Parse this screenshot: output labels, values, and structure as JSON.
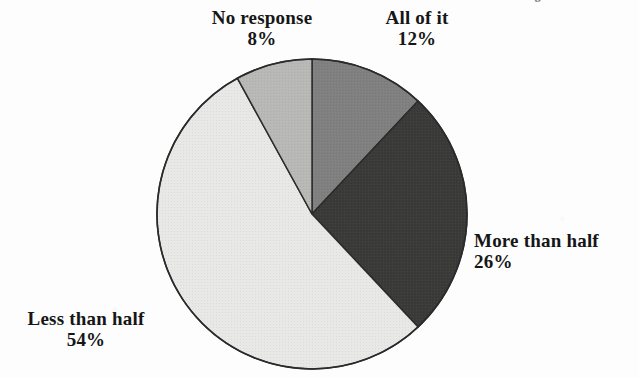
{
  "page": {
    "background_color": "#fdfdfd",
    "width": 639,
    "height": 377,
    "title_remnant": "g"
  },
  "chart_data": {
    "type": "pie",
    "title": "",
    "xlabel": "",
    "ylabel": "",
    "legend_position": "outside-labels",
    "grid": false,
    "start_angle_deg": 0,
    "direction": "clockwise",
    "center": {
      "x": 312,
      "y": 214
    },
    "radius": 155,
    "outline_color": "#2b2b2b",
    "categories": [
      "All of it",
      "More than half",
      "Less than half",
      "No response"
    ],
    "values": [
      12,
      26,
      54,
      8
    ],
    "value_suffix": "%",
    "colors": [
      "#808080",
      "#3a3a38",
      "#e8e8e6",
      "#b8b8b6"
    ],
    "slices": [
      {
        "label": "All of it",
        "percent_text": "12%",
        "value": 12,
        "color": "#808080",
        "start_deg": 0,
        "end_deg": 43.2
      },
      {
        "label": "More than half",
        "percent_text": "26%",
        "value": 26,
        "color": "#3a3a38",
        "start_deg": 43.2,
        "end_deg": 136.8
      },
      {
        "label": "Less than half",
        "percent_text": "54%",
        "value": 54,
        "color": "#e8e8e6",
        "start_deg": 136.8,
        "end_deg": 331.2
      },
      {
        "label": "No response",
        "percent_text": "8%",
        "value": 8,
        "color": "#b8b8b6",
        "start_deg": 331.2,
        "end_deg": 360
      }
    ]
  },
  "labels": {
    "no_response": {
      "name": "No response",
      "percent": "8%"
    },
    "all_of_it": {
      "name": "All of it",
      "percent": "12%"
    },
    "more_than_half": {
      "name": "More than half",
      "percent": "26%"
    },
    "less_than_half": {
      "name": "Less than half",
      "percent": "54%"
    }
  }
}
